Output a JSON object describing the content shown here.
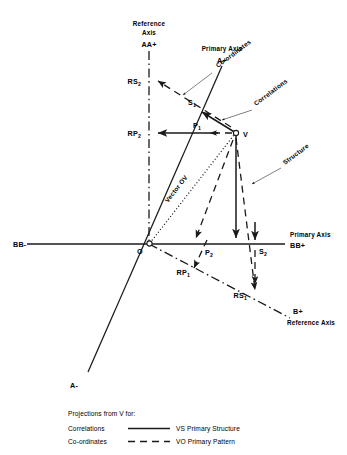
{
  "figure": {
    "background": "#ffffff",
    "ink": "#1a1a1a"
  },
  "axis_labels": {
    "reference_axis_top_line1": "Reference",
    "reference_axis_top_line2": "Axis",
    "reference_axis_top_name": "AA+",
    "primary_axis_top_label": "Primary Axis",
    "primary_axis_top_name": "A+",
    "primary_axis_right_label": "Primary Axis",
    "primary_axis_right_name": "BB+",
    "primary_axis_left_name": "BB-",
    "primary_axis_bottom_name": "A-",
    "reference_axis_right_name": "B+",
    "reference_axis_right_label": "Reference Axis"
  },
  "points": {
    "origin": "O",
    "vector_head": "V",
    "s1_base": "S",
    "s1_sub": "1",
    "s2_base": "S",
    "s2_sub": "2",
    "p1_base": "P",
    "p1_sub": "1",
    "p2_base": "P",
    "p2_sub": "2",
    "rs1_base": "RS",
    "rs1_sub": "1",
    "rs2_base": "RS",
    "rs2_sub": "2",
    "rp1_base": "RP",
    "rp1_sub": "1",
    "rp2_base": "RP",
    "rp2_sub": "2"
  },
  "callouts": {
    "coordinates": "Co-ordinates",
    "correlations": "Correlations",
    "structure": "Structure",
    "vector_ov": "Vector OV"
  },
  "legend": {
    "heading": "Projections from V for:",
    "rows": [
      {
        "name": "Correlations",
        "line_style": "solid",
        "target": "VS Primary Structure"
      },
      {
        "name": "Co-ordinates",
        "line_style": "dashed",
        "target": "VO Primary Pattern"
      }
    ]
  }
}
